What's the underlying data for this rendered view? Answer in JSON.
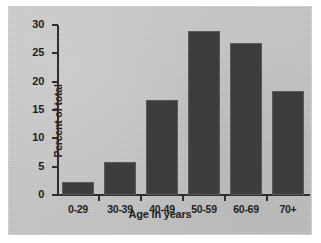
{
  "chart_data": {
    "type": "bar",
    "title": "",
    "xlabel": "Age in years",
    "ylabel": "Percent of total",
    "categories": [
      "0-29",
      "30-39",
      "40-49",
      "50-59",
      "60-69",
      "70+"
    ],
    "values": [
      2.3,
      5.8,
      16.8,
      29.0,
      26.9,
      18.3
    ],
    "ylim": [
      0,
      30
    ],
    "ytick_labels": [
      "0",
      "5",
      "10",
      "15",
      "20",
      "25",
      "30"
    ],
    "ytick_values": [
      0,
      5,
      10,
      15,
      20,
      25,
      30
    ],
    "grid": false,
    "legend": false,
    "legend_position": "none",
    "bar_color": "#3d3d3d",
    "panel_background": "#c9c9c9",
    "axis_color": "#2e2e2e",
    "text_color": "#1e1e1e"
  }
}
